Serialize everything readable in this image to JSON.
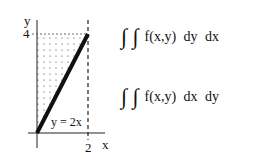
{
  "graph": {
    "axis_labels": {
      "x": "x",
      "y": "y"
    },
    "tick_labels": {
      "x_tick": "2",
      "y_tick": "4"
    },
    "curve_label": "y = 2x",
    "region": "triangle bounded by y-axis, y=4 and y=2x (dotted shading)"
  },
  "integrals": [
    {
      "signs": "∫ ∫",
      "expression": "f(x,y)  dy  dx"
    },
    {
      "signs": "∫ ∫",
      "expression": "f(x,y)  dx  dy"
    }
  ]
}
